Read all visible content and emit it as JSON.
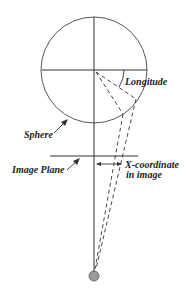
{
  "diagram": {
    "title": "",
    "labels": {
      "longitude": "Longitude",
      "sphere": "Sphere",
      "image_plane": "Image Plane",
      "x_coord_line1": "X-coordinate",
      "x_coord_line2": "in image"
    },
    "colors": {
      "line": "#333333",
      "viewpoint": "#999999",
      "background": "#ffffff"
    },
    "elements": [
      {
        "name": "sphere",
        "type": "circle",
        "cx": 94,
        "cy": 70,
        "r": 53
      },
      {
        "name": "vertical-axis",
        "type": "line"
      },
      {
        "name": "horizontal-axis",
        "type": "line"
      },
      {
        "name": "image-plane",
        "type": "line"
      },
      {
        "name": "projection-rays",
        "type": "dashed-lines",
        "count": 2
      },
      {
        "name": "viewpoint",
        "type": "dot"
      }
    ]
  }
}
